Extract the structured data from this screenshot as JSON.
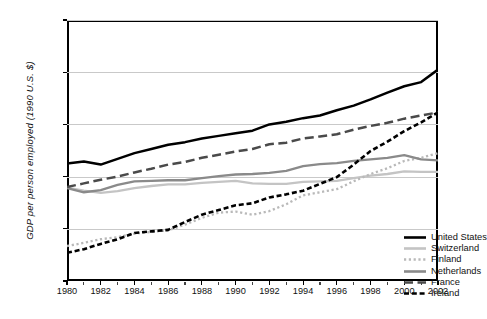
{
  "chart_data": {
    "type": "line",
    "title": "",
    "xlabel": "",
    "ylabel": "GDP per person employed (1990 U.S. $)",
    "xlim": [
      1980,
      2002
    ],
    "ylim": [
      20000,
      70000
    ],
    "ytick_values": [
      20000,
      30000,
      40000,
      50000,
      60000,
      70000
    ],
    "ytick_labels": [
      "20,000",
      "30,000",
      "40,000",
      "50,000",
      "60,000",
      "70,000"
    ],
    "xtick_values": [
      1980,
      1982,
      1984,
      1986,
      1988,
      1990,
      1992,
      1994,
      1996,
      1998,
      2000,
      2002
    ],
    "xtick_labels": [
      "1980",
      "1982",
      "1984",
      "1986",
      "1988",
      "1990",
      "1992",
      "1994",
      "1996",
      "1998",
      "2000",
      "2002"
    ],
    "xtick_minor_values": [
      1981,
      1983,
      1985,
      1987,
      1989,
      1991,
      1993,
      1995,
      1997,
      1999,
      2001
    ],
    "grid": "horizontal",
    "legend_position": "lower-right-inside",
    "x": [
      1980,
      1981,
      1982,
      1983,
      1984,
      1985,
      1986,
      1987,
      1988,
      1989,
      1990,
      1991,
      1992,
      1993,
      1994,
      1995,
      1996,
      1997,
      1998,
      1999,
      2000,
      2001,
      2002
    ],
    "series": [
      {
        "name": "United States",
        "style": "solid",
        "color": "#000000",
        "width": 2.5,
        "values": [
          42500,
          42900,
          42300,
          43400,
          44500,
          45300,
          46100,
          46600,
          47300,
          47800,
          48300,
          48800,
          50000,
          50500,
          51200,
          51700,
          52700,
          53600,
          54800,
          56100,
          57300,
          58100,
          60500
        ]
      },
      {
        "name": "Switzerland",
        "style": "solid",
        "color": "#c4c4c4",
        "width": 2.3,
        "values": [
          37900,
          37300,
          36900,
          37200,
          37800,
          38200,
          38500,
          38500,
          38800,
          39000,
          39200,
          38700,
          38600,
          38600,
          39000,
          39100,
          39200,
          39700,
          40200,
          40500,
          41000,
          40900,
          40900
        ]
      },
      {
        "name": "Finland",
        "style": "dotted",
        "color": "#b9b9b9",
        "width": 2.3,
        "values": [
          26700,
          27300,
          28000,
          28400,
          29100,
          29400,
          29700,
          30800,
          32100,
          33100,
          33300,
          32700,
          33400,
          34700,
          36400,
          37000,
          37600,
          39100,
          40500,
          41600,
          43000,
          43600,
          44500
        ]
      },
      {
        "name": "Netherlands",
        "style": "solid",
        "color": "#8a8a8a",
        "width": 2.3,
        "values": [
          37800,
          37000,
          37400,
          38400,
          39100,
          39200,
          39300,
          39300,
          39700,
          40100,
          40400,
          40500,
          40700,
          41100,
          42000,
          42400,
          42600,
          43000,
          43300,
          43600,
          44100,
          43300,
          43100
        ]
      },
      {
        "name": "France",
        "style": "dashed-long",
        "color": "#4a4a4a",
        "width": 2.5,
        "values": [
          38000,
          38700,
          39400,
          40000,
          40800,
          41500,
          42300,
          42800,
          43600,
          44200,
          44800,
          45300,
          46200,
          46500,
          47300,
          47700,
          48100,
          49000,
          49700,
          50300,
          51100,
          51700,
          52300
        ]
      },
      {
        "name": "Ireland",
        "style": "dashed-short",
        "color": "#000000",
        "width": 2.6,
        "values": [
          25400,
          26100,
          27100,
          28000,
          29200,
          29500,
          29800,
          31300,
          32700,
          33600,
          34500,
          34900,
          36000,
          36600,
          37300,
          38600,
          39900,
          42300,
          44900,
          46700,
          48700,
          50400,
          52300
        ]
      }
    ]
  },
  "legend": {
    "items": [
      {
        "label": "United States"
      },
      {
        "label": "Switzerland"
      },
      {
        "label": "Finland"
      },
      {
        "label": "Netherlands"
      },
      {
        "label": "France"
      },
      {
        "label": "Ireland"
      }
    ]
  },
  "caption": {
    "text": ""
  }
}
